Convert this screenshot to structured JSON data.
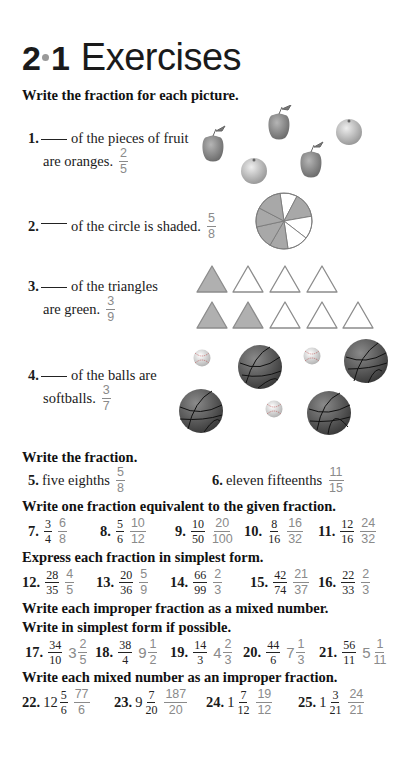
{
  "title": {
    "section": "2",
    "subsection": "1",
    "word": "Exercises"
  },
  "part1": {
    "heading": "Write the fraction for each picture.",
    "items": [
      {
        "num": "1.",
        "line1": "of the pieces of fruit",
        "line2": "are oranges.",
        "answer": {
          "n": "2",
          "d": "5"
        },
        "picture": "fruit-icon-group",
        "picture_detail": "3 apples, 2 oranges"
      },
      {
        "num": "2.",
        "line1": "of the circle is shaded.",
        "answer": {
          "n": "5",
          "d": "8"
        },
        "picture": "pie-circle-icon",
        "picture_detail": "circle divided into 8 parts, 5 shaded"
      },
      {
        "num": "3.",
        "line1": "of the triangles",
        "line2": "are green.",
        "answer": {
          "n": "3",
          "d": "9"
        },
        "picture": "triangle-icon-group",
        "picture_detail": "9 triangles, 3 shaded"
      },
      {
        "num": "4.",
        "line1": "of the balls are",
        "line2": "softballs.",
        "answer": {
          "n": "3",
          "d": "7"
        },
        "picture": "ball-icon-group",
        "picture_detail": "4 basketballs, 3 softballs"
      }
    ]
  },
  "part2": {
    "heading": "Write the fraction.",
    "items": [
      {
        "num": "5.",
        "text": "five eighths",
        "answer": {
          "n": "5",
          "d": "8"
        }
      },
      {
        "num": "6.",
        "text": "eleven fifteenths",
        "answer": {
          "n": "11",
          "d": "15"
        }
      }
    ]
  },
  "part3": {
    "heading": "Write one fraction equivalent to the given fraction.",
    "items": [
      {
        "num": "7.",
        "q": {
          "n": "3",
          "d": "4"
        },
        "a": {
          "n": "6",
          "d": "8"
        }
      },
      {
        "num": "8.",
        "q": {
          "n": "5",
          "d": "6"
        },
        "a": {
          "n": "10",
          "d": "12"
        }
      },
      {
        "num": "9.",
        "q": {
          "n": "10",
          "d": "50"
        },
        "a": {
          "n": "20",
          "d": "100"
        }
      },
      {
        "num": "10.",
        "q": {
          "n": "8",
          "d": "16"
        },
        "a": {
          "n": "16",
          "d": "32"
        }
      },
      {
        "num": "11.",
        "q": {
          "n": "12",
          "d": "16"
        },
        "a": {
          "n": "24",
          "d": "32"
        }
      }
    ]
  },
  "part4": {
    "heading": "Express each fraction in simplest form.",
    "items": [
      {
        "num": "12.",
        "q": {
          "n": "28",
          "d": "35"
        },
        "a": {
          "n": "4",
          "d": "5"
        }
      },
      {
        "num": "13.",
        "q": {
          "n": "20",
          "d": "36"
        },
        "a": {
          "n": "5",
          "d": "9"
        }
      },
      {
        "num": "14.",
        "q": {
          "n": "66",
          "d": "99"
        },
        "a": {
          "n": "2",
          "d": "3"
        }
      },
      {
        "num": "15.",
        "q": {
          "n": "42",
          "d": "74"
        },
        "a": {
          "n": "21",
          "d": "37"
        }
      },
      {
        "num": "16.",
        "q": {
          "n": "22",
          "d": "33"
        },
        "a": {
          "n": "2",
          "d": "3"
        }
      }
    ]
  },
  "part5": {
    "heading1": "Write each improper fraction as a mixed number.",
    "heading2": "Write in simplest form if possible.",
    "items": [
      {
        "num": "17.",
        "q": {
          "n": "34",
          "d": "10"
        },
        "a": {
          "w": "3",
          "n": "2",
          "d": "5"
        }
      },
      {
        "num": "18.",
        "q": {
          "n": "38",
          "d": "4"
        },
        "a": {
          "w": "9",
          "n": "1",
          "d": "2"
        }
      },
      {
        "num": "19.",
        "q": {
          "n": "14",
          "d": "3"
        },
        "a": {
          "w": "4",
          "n": "2",
          "d": "3"
        }
      },
      {
        "num": "20.",
        "q": {
          "n": "44",
          "d": "6"
        },
        "a": {
          "w": "7",
          "n": "1",
          "d": "3"
        }
      },
      {
        "num": "21.",
        "q": {
          "n": "56",
          "d": "11"
        },
        "a": {
          "w": "5",
          "n": "1",
          "d": "11"
        }
      }
    ]
  },
  "part6": {
    "heading": "Write each mixed number as an improper fraction.",
    "items": [
      {
        "num": "22.",
        "q": {
          "w": "12",
          "n": "5",
          "d": "6"
        },
        "a": {
          "n": "77",
          "d": "6"
        }
      },
      {
        "num": "23.",
        "q": {
          "w": "9",
          "n": "7",
          "d": "20"
        },
        "a": {
          "n": "187",
          "d": "20"
        }
      },
      {
        "num": "24.",
        "q": {
          "w": "1",
          "n": "7",
          "d": "12"
        },
        "a": {
          "n": "19",
          "d": "12"
        }
      },
      {
        "num": "25.",
        "q": {
          "w": "1",
          "n": "3",
          "d": "21"
        },
        "a": {
          "n": "24",
          "d": "21"
        }
      }
    ]
  },
  "colors": {
    "text": "#1a1a1a",
    "answer": "#8a8a8a",
    "shade": "#a8a8a8",
    "outline": "#8c8c8c"
  }
}
